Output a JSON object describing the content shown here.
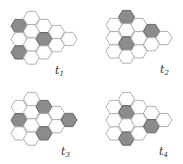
{
  "figure": {
    "colors": {
      "empty_fill": "#ffffff",
      "empty_stroke": "#a8a8a8",
      "filled_fill": "#8c8c8c",
      "filled_stroke": "#5e5e5e",
      "label": "#333333"
    },
    "grid_columns": [
      3,
      4,
      3,
      2,
      1
    ],
    "panels": [
      {
        "id": "t1",
        "label": "t",
        "subscript": "1",
        "filled_cells": [
          [
            0,
            0
          ],
          [
            0,
            2
          ],
          [
            2,
            1
          ]
        ]
      },
      {
        "id": "t2",
        "label": "t",
        "subscript": "2",
        "filled_cells": [
          [
            1,
            0
          ],
          [
            1,
            2
          ],
          [
            3,
            0
          ]
        ]
      },
      {
        "id": "t3",
        "label": "t",
        "subscript": "3",
        "filled_cells": [
          [
            0,
            1
          ],
          [
            2,
            0
          ],
          [
            2,
            2
          ],
          [
            4,
            0
          ]
        ]
      },
      {
        "id": "t4",
        "label": "t",
        "subscript": "4",
        "filled_cells": [
          [
            1,
            1
          ],
          [
            1,
            3
          ],
          [
            3,
            1
          ]
        ]
      }
    ]
  }
}
